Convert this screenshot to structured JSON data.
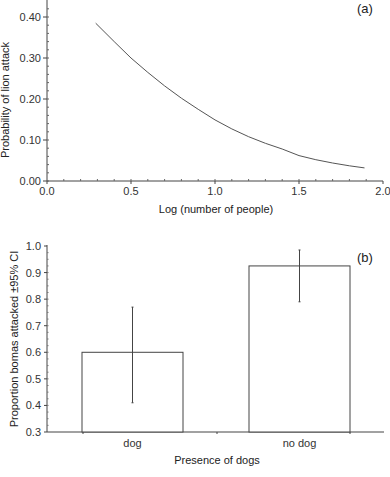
{
  "chart_data": [
    {
      "type": "line",
      "panel_label": "(a)",
      "title": "",
      "xlabel": "Log (number of people)",
      "ylabel": "Probability of lion attack",
      "xlim": [
        0.0,
        2.0
      ],
      "ylim": [
        0.0,
        0.4
      ],
      "x_ticks": [
        "0.0",
        "0.5",
        "1.0",
        "1.5",
        "2.0"
      ],
      "y_ticks": [
        "0.00",
        "0.10",
        "0.20",
        "0.30",
        "0.40"
      ],
      "grid": false,
      "legend": null,
      "series": [
        {
          "name": "Probability of lion attack",
          "x": [
            0.29,
            0.4,
            0.5,
            0.6,
            0.7,
            0.8,
            0.9,
            1.0,
            1.1,
            1.2,
            1.3,
            1.4,
            1.5,
            1.6,
            1.7,
            1.8,
            1.89
          ],
          "y": [
            0.385,
            0.34,
            0.3,
            0.265,
            0.232,
            0.202,
            0.175,
            0.149,
            0.127,
            0.108,
            0.092,
            0.078,
            0.062,
            0.052,
            0.044,
            0.037,
            0.032
          ]
        }
      ]
    },
    {
      "type": "bar",
      "panel_label": "(b)",
      "title": "",
      "xlabel": "Presence of dogs",
      "ylabel": "Proportion bomas attacked ±95% CI",
      "ylim": [
        0.3,
        1.0
      ],
      "y_ticks": [
        "0.3",
        "0.4",
        "0.5",
        "0.6",
        "0.7",
        "0.8",
        "0.9",
        "1.0"
      ],
      "grid": false,
      "legend": null,
      "categories": [
        "dog",
        "no dog"
      ],
      "values": [
        0.6,
        0.925
      ],
      "error_low": [
        0.41,
        0.79
      ],
      "error_high": [
        0.77,
        0.985
      ]
    }
  ]
}
